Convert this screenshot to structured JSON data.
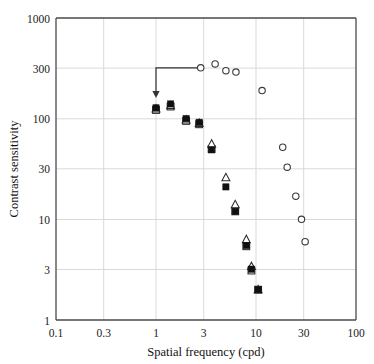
{
  "chart_data": {
    "type": "scatter",
    "title": "",
    "xlabel": "Spatial frequency (cpd)",
    "ylabel": "Contrast sensitivity",
    "xscale": "log",
    "yscale": "log",
    "xlim": [
      0.1,
      100
    ],
    "ylim": [
      1,
      1000
    ],
    "grid": true,
    "legend": "none",
    "xticks": [
      "0.1",
      "0.3",
      "1",
      "3",
      "10",
      "30",
      "100"
    ],
    "xtick_values": [
      0.1,
      0.3,
      1,
      3,
      10,
      30,
      100
    ],
    "yticks": [
      "1",
      "3",
      "10",
      "30",
      "100",
      "300",
      "1000"
    ],
    "ytick_values": [
      1,
      3,
      10,
      30,
      100,
      300,
      1000
    ],
    "series": [
      {
        "name": "open-circle",
        "marker": "open-circle",
        "points": [
          {
            "x": 2.8,
            "y": 320
          },
          {
            "x": 3.9,
            "y": 350
          },
          {
            "x": 5.0,
            "y": 300
          },
          {
            "x": 6.3,
            "y": 290
          },
          {
            "x": 11.5,
            "y": 190
          },
          {
            "x": 18.5,
            "y": 52
          },
          {
            "x": 20.5,
            "y": 33
          },
          {
            "x": 25.0,
            "y": 17
          },
          {
            "x": 28.5,
            "y": 10
          },
          {
            "x": 31.0,
            "y": 6
          }
        ]
      },
      {
        "name": "filled-square",
        "marker": "filled-square",
        "points": [
          {
            "x": 1.0,
            "y": 128
          },
          {
            "x": 1.4,
            "y": 140
          },
          {
            "x": 2.0,
            "y": 100
          },
          {
            "x": 2.7,
            "y": 92
          },
          {
            "x": 3.6,
            "y": 49
          },
          {
            "x": 5.0,
            "y": 21
          },
          {
            "x": 6.2,
            "y": 12
          },
          {
            "x": 8.0,
            "y": 5.5
          },
          {
            "x": 9.0,
            "y": 3.2
          },
          {
            "x": 10.5,
            "y": 2.0
          }
        ]
      },
      {
        "name": "open-triangle",
        "marker": "open-triangle",
        "points": [
          {
            "x": 1.0,
            "y": 125
          },
          {
            "x": 1.4,
            "y": 135
          },
          {
            "x": 2.0,
            "y": 97
          },
          {
            "x": 2.7,
            "y": 90
          },
          {
            "x": 3.6,
            "y": 56
          },
          {
            "x": 5.0,
            "y": 26
          },
          {
            "x": 6.2,
            "y": 14
          },
          {
            "x": 8.0,
            "y": 6.3
          },
          {
            "x": 9.0,
            "y": 3.4
          },
          {
            "x": 10.5,
            "y": 2.0
          }
        ]
      },
      {
        "name": "open-square",
        "marker": "open-square",
        "points": [
          {
            "x": 1.0,
            "y": 122
          },
          {
            "x": 1.4,
            "y": 132
          },
          {
            "x": 2.0,
            "y": 95
          },
          {
            "x": 2.7,
            "y": 88
          },
          {
            "x": 3.6,
            "y": 50
          },
          {
            "x": 6.2,
            "y": 12
          },
          {
            "x": 8.0,
            "y": 5.4
          },
          {
            "x": 9.0,
            "y": 3.1
          },
          {
            "x": 10.5,
            "y": 2.0
          }
        ]
      }
    ],
    "annotations": [
      {
        "type": "arrow",
        "name": "cutoff-arrow",
        "from": {
          "x": 2.8,
          "y": 320
        },
        "corner": {
          "x": 1.0,
          "y": 320
        },
        "to": {
          "x": 1.0,
          "y": 160
        }
      }
    ]
  }
}
